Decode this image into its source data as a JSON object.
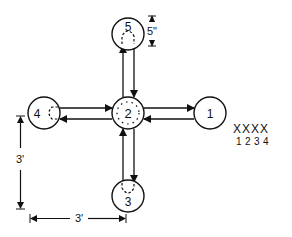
{
  "diagram": {
    "type": "flow-layout",
    "stroke_color": "#111111",
    "background": "#ffffff",
    "nodes": [
      {
        "id": "1",
        "label": "1",
        "cx": 210,
        "cy": 113,
        "r": 16,
        "inner": "none"
      },
      {
        "id": "2",
        "label": "2",
        "cx": 128,
        "cy": 113,
        "r": 16,
        "inner": "dotted-ring"
      },
      {
        "id": "3",
        "label": "3",
        "cx": 128,
        "cy": 196,
        "r": 16,
        "inner": "dashed-arch-up"
      },
      {
        "id": "4",
        "label": "4",
        "cx": 44,
        "cy": 113,
        "r": 16,
        "inner": "dashed-arch-right"
      },
      {
        "id": "5",
        "label": "5",
        "cx": 128,
        "cy": 34,
        "r": 16,
        "inner": "dashed-arch-down"
      }
    ],
    "edges": [
      {
        "from": "4",
        "to": "2"
      },
      {
        "from": "2",
        "to": "4"
      },
      {
        "from": "2",
        "to": "1"
      },
      {
        "from": "1",
        "to": "2"
      },
      {
        "from": "2",
        "to": "5"
      },
      {
        "from": "5",
        "to": "2"
      },
      {
        "from": "2",
        "to": "3"
      },
      {
        "from": "3",
        "to": "2"
      }
    ],
    "dimensions": {
      "node_diameter": "5\"",
      "vertical_spacing": "3'",
      "horizontal_spacing": "3'"
    },
    "legend": {
      "marks": [
        "X",
        "X",
        "X",
        "X"
      ],
      "numbers": [
        "1",
        "2",
        "3",
        "4"
      ]
    }
  }
}
